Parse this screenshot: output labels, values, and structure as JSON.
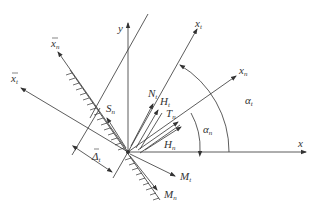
{
  "figure": {
    "type": "coordinate-force-diagram",
    "axes": {
      "x": "x",
      "y": "y",
      "x_t": {
        "base": "x",
        "sub": "t"
      },
      "x_n": {
        "base": "x",
        "sub": "n"
      },
      "xbar_n": {
        "base": "x",
        "sub": "n",
        "overbar": true
      },
      "xbar_t": {
        "base": "x",
        "sub": "t",
        "overbar": true
      }
    },
    "forces": {
      "N_t": {
        "base": "N",
        "sub": "t"
      },
      "H_t": {
        "base": "H",
        "sub": "t"
      },
      "T_n": {
        "base": "T",
        "sub": "n"
      },
      "H_n": {
        "base": "H",
        "sub": "n"
      },
      "S_n": {
        "base": "S",
        "sub": "n"
      },
      "M_t": {
        "base": "M",
        "sub": "t"
      },
      "M_n": {
        "base": "M",
        "sub": "n"
      }
    },
    "angles": {
      "alpha_t": {
        "base": "α",
        "sub": "t"
      },
      "alpha_n": {
        "base": "α",
        "sub": "n"
      }
    },
    "dimension": {
      "base": "Δ",
      "sub": "t",
      "overbar": true
    },
    "colors": {
      "line": "#333333",
      "background": "#ffffff"
    }
  }
}
